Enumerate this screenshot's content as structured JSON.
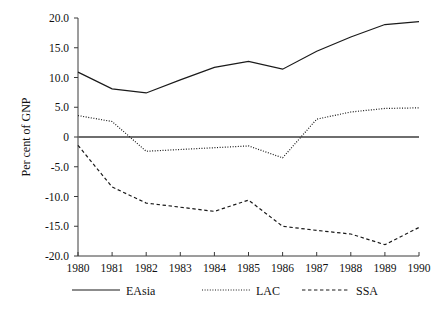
{
  "chart_data": {
    "type": "line",
    "title": "",
    "subtitle": "",
    "xlabel": "",
    "ylabel": "Per cent of GNP",
    "x": [
      1980,
      1981,
      1982,
      1983,
      1984,
      1985,
      1986,
      1987,
      1988,
      1989,
      1990
    ],
    "xtick_labels": [
      "1980",
      "1981",
      "1982",
      "1983",
      "1984",
      "1985",
      "1986",
      "1987",
      "1988",
      "1989",
      "1990"
    ],
    "ytick_labels": [
      "20.0",
      "15.0",
      "10.0",
      "5.0",
      "0",
      "-5.0",
      "-10.0",
      "-15.0",
      "-20.0"
    ],
    "ytick_values": [
      20.0,
      15.0,
      10.0,
      5.0,
      0,
      -5.0,
      -10.0,
      -15.0,
      -20.0
    ],
    "xlim": [
      1980,
      1990
    ],
    "ylim": [
      -20.0,
      20.0
    ],
    "grid": false,
    "zero_line": true,
    "legend_position": "bottom",
    "series": [
      {
        "name": "EAsia",
        "style": "solid",
        "color": "#1a1a1a",
        "values": [
          10.9,
          8.1,
          7.4,
          9.6,
          11.7,
          12.7,
          11.4,
          14.4,
          16.8,
          18.9,
          19.4
        ]
      },
      {
        "name": "LAC",
        "style": "dotted",
        "color": "#1a1a1a",
        "values": [
          3.6,
          2.6,
          -2.4,
          -2.1,
          -1.8,
          -1.5,
          -3.5,
          3.0,
          4.2,
          4.8,
          4.9
        ]
      },
      {
        "name": "SSA",
        "style": "dashed",
        "color": "#1a1a1a",
        "values": [
          -1.4,
          -8.4,
          -11.1,
          -11.8,
          -12.5,
          -10.6,
          -15.0,
          -15.7,
          -16.3,
          -18.1,
          -15.2
        ]
      }
    ]
  },
  "axes": {
    "y_title": "Per cent of GNP"
  },
  "legend": {
    "entries": [
      {
        "label": "EAsia",
        "style": "solid"
      },
      {
        "label": "LAC",
        "style": "dotted"
      },
      {
        "label": "SSA",
        "style": "dashed"
      }
    ]
  },
  "colors": {
    "series_ink": "#1a1a1a",
    "axis": "#3a3a3a",
    "zero_line": "#6e6e6e",
    "background": "#ffffff",
    "text": "#111111"
  }
}
